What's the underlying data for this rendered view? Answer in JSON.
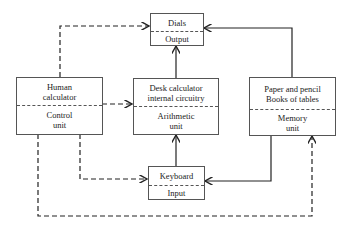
{
  "diagram": {
    "nodes": {
      "dials": {
        "top": "Dials",
        "bottom": "Output"
      },
      "human": {
        "top": "Human calculator",
        "top_l1": "Human",
        "top_l2": "calculator",
        "bottom_l1": "Control",
        "bottom_l2": "unit"
      },
      "desk": {
        "top_l1": "Desk calculator",
        "top_l2": "internal circuitry",
        "bottom_l1": "Arithmetic",
        "bottom_l2": "unit"
      },
      "paper": {
        "top_l1": "Paper and pencil",
        "top_l2": "Books of tables",
        "bottom_l1": "Memory",
        "bottom_l2": "unit"
      },
      "keyboard": {
        "top": "Keyboard",
        "bottom": "Input"
      }
    },
    "edges": [
      {
        "from": "Human calculator / Control unit",
        "to": "Dials / Output",
        "style": "dashed"
      },
      {
        "from": "Human calculator / Control unit",
        "to": "Desk calculator / Arithmetic unit",
        "style": "dashed"
      },
      {
        "from": "Human calculator / Control unit",
        "to": "Keyboard / Input",
        "style": "dashed"
      },
      {
        "from": "Human calculator / Control unit",
        "to": "Paper and pencil / Memory unit",
        "style": "dashed"
      },
      {
        "from": "Desk calculator / Arithmetic unit",
        "to": "Dials / Output",
        "style": "solid"
      },
      {
        "from": "Keyboard / Input",
        "to": "Desk calculator / Arithmetic unit",
        "style": "solid"
      },
      {
        "from": "Paper and pencil / Memory unit",
        "to": "Dials / Output",
        "style": "solid"
      },
      {
        "from": "Paper and pencil / Memory unit",
        "to": "Keyboard / Input",
        "style": "solid"
      }
    ]
  }
}
